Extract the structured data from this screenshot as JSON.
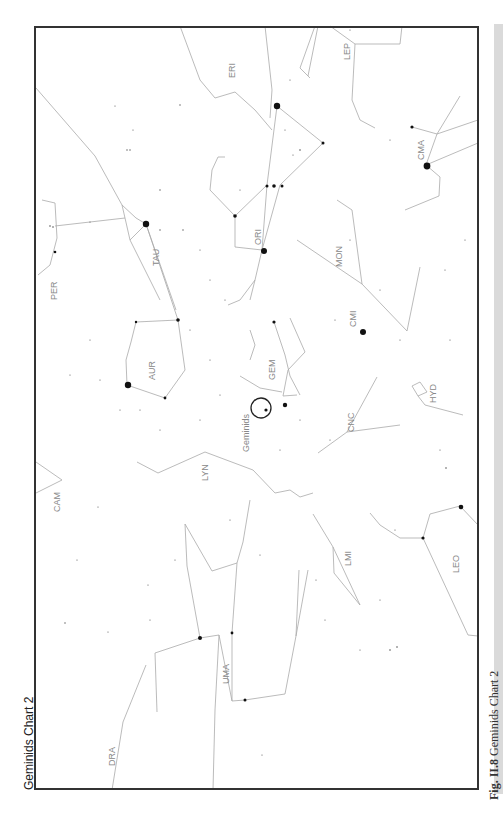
{
  "figure": {
    "title": "Geminids Chart 2",
    "caption_prefix": "Fig. II.8",
    "caption_text": "Geminids Chart 2"
  },
  "chart": {
    "orientation": "rotated -90°",
    "radiant": {
      "name": "Geminids",
      "x": 261,
      "y": 408,
      "r": 10
    },
    "colors": {
      "lines": "#aaaaaa",
      "stars": "#111111",
      "labels": "#888888",
      "border": "#333333",
      "caption_bg": "#dadada"
    },
    "constellations": [
      {
        "abbr": "ERI",
        "x": 232,
        "y": 68
      },
      {
        "abbr": "LEP",
        "x": 347,
        "y": 52
      },
      {
        "abbr": "CMA",
        "x": 421,
        "y": 150
      },
      {
        "abbr": "ORI",
        "x": 260,
        "y": 240
      },
      {
        "abbr": "TAU",
        "x": 157,
        "y": 258
      },
      {
        "abbr": "MON",
        "x": 340,
        "y": 260
      },
      {
        "abbr": "PER",
        "x": 55,
        "y": 290
      },
      {
        "abbr": "CMI",
        "x": 353,
        "y": 320
      },
      {
        "abbr": "AUR",
        "x": 152,
        "y": 370
      },
      {
        "abbr": "GEM",
        "x": 272,
        "y": 362
      },
      {
        "abbr": "HYD",
        "x": 433,
        "y": 395
      },
      {
        "abbr": "Geminids",
        "x": 246,
        "y": 436
      },
      {
        "abbr": "CNC",
        "x": 352,
        "y": 418
      },
      {
        "abbr": "LYN",
        "x": 206,
        "y": 470
      },
      {
        "abbr": "CAM",
        "x": 58,
        "y": 505
      },
      {
        "abbr": "LMI",
        "x": 348,
        "y": 555
      },
      {
        "abbr": "LEO",
        "x": 456,
        "y": 565
      },
      {
        "abbr": "UMA",
        "x": 226,
        "y": 674
      },
      {
        "abbr": "DRA",
        "x": 112,
        "y": 758
      }
    ]
  }
}
